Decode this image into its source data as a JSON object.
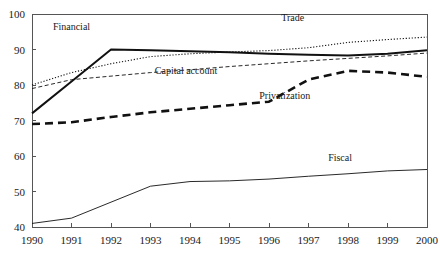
{
  "chart_data": {
    "type": "line",
    "title": "",
    "subtitle": "",
    "xlabel": "",
    "ylabel": "",
    "categories": [
      "1990",
      "1991",
      "1992",
      "1993",
      "1994",
      "1995",
      "1996",
      "1997",
      "1998",
      "1999",
      "2000"
    ],
    "x": [
      1990,
      1991,
      1992,
      1993,
      1994,
      1995,
      1996,
      1997,
      1998,
      1999,
      2000
    ],
    "xlim": [
      1990,
      2000
    ],
    "ylim": [
      40,
      100
    ],
    "yticks": [
      40,
      50,
      60,
      70,
      80,
      90,
      100
    ],
    "xticks": [
      "1990",
      "1991",
      "1992",
      "1993",
      "1994",
      "1995",
      "1996",
      "1997",
      "1998",
      "1999",
      "2000"
    ],
    "grid": false,
    "legend_position": "inline-annotations",
    "series": [
      {
        "name": "Trade",
        "style": "dotted",
        "color": "#111111",
        "values": [
          80.0,
          83.5,
          86.0,
          88.0,
          88.8,
          89.3,
          89.7,
          90.5,
          92.0,
          92.8,
          93.5
        ],
        "label_x": 1996.6,
        "label_y": 98.0
      },
      {
        "name": "Financial",
        "style": "solid-thick",
        "color": "#111111",
        "values": [
          72.0,
          81.0,
          90.0,
          89.8,
          89.5,
          89.2,
          88.8,
          88.5,
          88.3,
          88.8,
          89.8
        ],
        "label_x": 1991.0,
        "label_y": 95.5
      },
      {
        "name": "Capital account",
        "style": "dashed-thin",
        "color": "#111111",
        "values": [
          79.0,
          81.5,
          82.5,
          83.5,
          84.3,
          85.2,
          86.0,
          86.8,
          87.5,
          88.2,
          89.0
        ],
        "label_x": 1993.9,
        "label_y": 83.0
      },
      {
        "name": "Privatization",
        "style": "dashed-thick",
        "color": "#111111",
        "values": [
          69.0,
          69.5,
          71.0,
          72.3,
          73.3,
          74.3,
          75.3,
          81.5,
          84.0,
          83.5,
          82.3
        ],
        "label_x": 1996.4,
        "label_y": 76.0
      },
      {
        "name": "Fiscal",
        "style": "solid-thin",
        "color": "#111111",
        "values": [
          41.0,
          42.5,
          47.0,
          51.5,
          52.8,
          53.0,
          53.5,
          54.3,
          55.0,
          55.8,
          56.2
        ],
        "label_x": 1997.8,
        "label_y": 58.5
      }
    ],
    "axis": {
      "top_border": true,
      "right_border": true,
      "left_border": true,
      "bottom_border": true,
      "frame_color": "#555555"
    }
  }
}
